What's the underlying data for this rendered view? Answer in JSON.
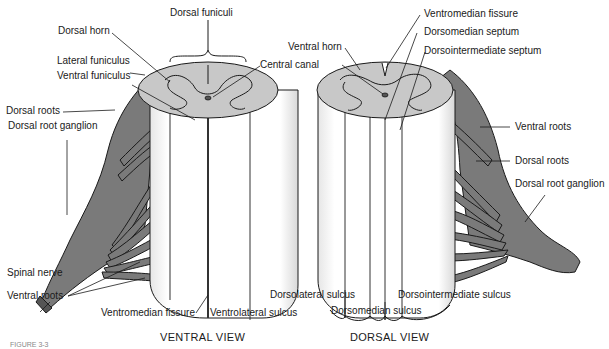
{
  "figure": {
    "caption": "FIGURE 3-3",
    "colors": {
      "gray_matter_fill": "#c8c8c8",
      "nerve_fill": "#7a7a7a",
      "outline": "#1a1a1a",
      "column_fill": "#ffffff"
    }
  },
  "ventral_view": {
    "title": "VENTRAL VIEW",
    "labels": {
      "dorsal_funiculi": "Dorsal funiculi",
      "dorsal_horn": "Dorsal horn",
      "lateral_funiculus": "Lateral funiculus",
      "ventral_funiculus": "Ventral funiculus",
      "central_canal": "Central canal",
      "dorsal_roots": "Dorsal roots",
      "dorsal_root_ganglion": "Dorsal root ganglion",
      "spinal_nerve": "Spinal nerve",
      "ventral_roots": "Ventral roots",
      "ventromedian_fissure": "Ventromedian fissure",
      "ventrolateral_sulcus": "Ventrolateral sulcus"
    }
  },
  "dorsal_view": {
    "title": "DORSAL VIEW",
    "labels": {
      "ventral_horn": "Ventral horn",
      "ventromedian_fissure": "Ventromedian fissure",
      "dorsomedian_septum": "Dorsomedian septum",
      "dorsointermediate_septum": "Dorsointermediate septum",
      "ventral_roots": "Ventral roots",
      "dorsal_roots": "Dorsal roots",
      "dorsal_root_ganglion": "Dorsal root ganglion",
      "dorsolateral_sulcus": "Dorsolateral sulcus",
      "dorsomedian_sulcus": "Dorsomedian sulcus",
      "dorsointermediate_sulcus": "Dorsointermediate sulcus"
    }
  }
}
